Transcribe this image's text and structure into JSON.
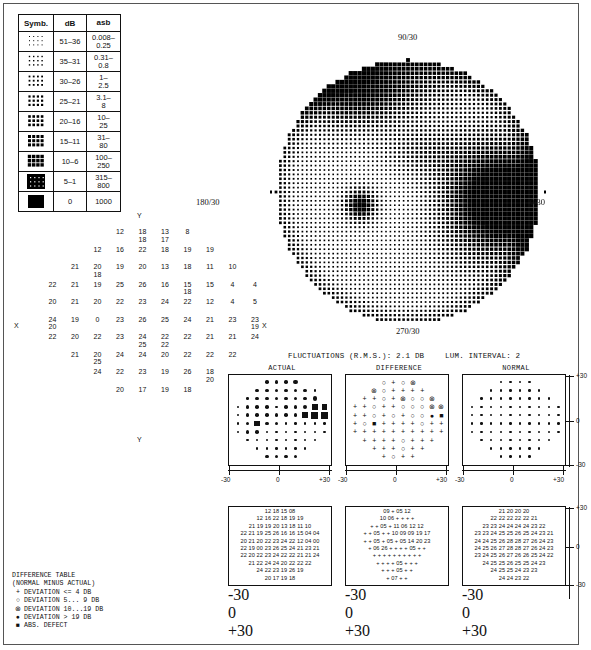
{
  "legend": {
    "headers": [
      "Symb.",
      "dB",
      "asb"
    ],
    "rows": [
      {
        "density": 1,
        "db": "51–36",
        "asb": "0.008– 0.25"
      },
      {
        "density": 2,
        "db": "35–31",
        "asb": "0.31– 0.8"
      },
      {
        "density": 3,
        "db": "30–26",
        "asb": "1– 2.5"
      },
      {
        "density": 4,
        "db": "25–21",
        "asb": "3.1– 8"
      },
      {
        "density": 5,
        "db": "20–16",
        "asb": "10– 25"
      },
      {
        "density": 6,
        "db": "15–11",
        "asb": "31– 80"
      },
      {
        "density": 7,
        "db": "10–6",
        "asb": "100– 250"
      },
      {
        "density": 8,
        "db": "5–1",
        "asb": "315– 800"
      },
      {
        "density": 9,
        "db": "0",
        "asb": "1000"
      }
    ]
  },
  "bigmap": {
    "label_top": "90/30",
    "label_bottom": "270/30",
    "label_left": "180/30",
    "label_right": "0/30"
  },
  "field_axis": {
    "x_label": "X",
    "y_label": "Y"
  },
  "field_numbers": {
    "rows": [
      {
        "start": 4,
        "values": [
          "12",
          "18\n18",
          "13\n17",
          "8"
        ]
      },
      {
        "start": 3,
        "values": [
          "12",
          "16",
          "22",
          "18",
          "19",
          "19"
        ]
      },
      {
        "start": 2,
        "values": [
          "21",
          "20\n18",
          "19",
          "20",
          "13",
          "18",
          "11",
          "10"
        ]
      },
      {
        "start": 1,
        "values": [
          "22",
          "21",
          "19",
          "25",
          "26",
          "16",
          "15\n18",
          "15",
          "4",
          "4"
        ]
      },
      {
        "start": 1,
        "values": [
          "20",
          "21",
          "20",
          "22",
          "23",
          "24",
          "22",
          "12",
          "4",
          "5"
        ]
      },
      {
        "start": 1,
        "values": [
          "24\n20",
          "19",
          "0",
          "23",
          "26",
          "25",
          "24",
          "21",
          "23",
          "23\n19"
        ]
      },
      {
        "start": 1,
        "values": [
          "22",
          "20",
          "22",
          "23",
          "24\n25",
          "22\n22",
          "22",
          "21",
          "21",
          "24"
        ]
      },
      {
        "start": 2,
        "values": [
          "21",
          "20\n25",
          "24",
          "24",
          "20",
          "22",
          "22",
          "22"
        ]
      },
      {
        "start": 3,
        "values": [
          "24",
          "22",
          "23",
          "19",
          "26",
          "18\n20"
        ]
      },
      {
        "start": 4,
        "values": [
          "20",
          "17",
          "19",
          "18"
        ]
      }
    ]
  },
  "fluctuations": {
    "rms_label": "FLUCTUATIONS (R.M.S.):  2.1 DB",
    "lum_label": "LUM. INTERVAL: 2"
  },
  "panels": {
    "titles": [
      "ACTUAL",
      "DIFFERENCE",
      "NORMAL"
    ],
    "x_ticks": [
      "-30",
      "0",
      "+30"
    ],
    "y_ticks": [
      "+30",
      "0",
      "-30"
    ],
    "actual": [
      [
        0,
        0,
        0,
        3,
        3,
        3,
        4,
        0,
        0,
        0
      ],
      [
        0,
        0,
        3,
        3,
        3,
        3,
        3,
        3,
        2,
        0
      ],
      [
        0,
        2,
        3,
        3,
        3,
        3,
        3,
        3,
        4,
        0
      ],
      [
        2,
        3,
        3,
        3,
        2,
        3,
        3,
        4,
        5,
        5
      ],
      [
        2,
        3,
        3,
        3,
        3,
        3,
        3,
        5,
        6,
        6
      ],
      [
        2,
        3,
        5,
        3,
        3,
        2,
        2,
        2,
        2,
        2
      ],
      [
        2,
        3,
        3,
        2,
        2,
        2,
        2,
        2,
        2,
        2
      ],
      [
        0,
        2,
        2,
        2,
        2,
        2,
        2,
        2,
        2,
        0
      ],
      [
        0,
        0,
        2,
        2,
        2,
        2,
        2,
        2,
        0,
        0
      ],
      [
        0,
        0,
        0,
        3,
        3,
        3,
        3,
        0,
        0,
        0
      ]
    ],
    "difference": [
      [
        "",
        "",
        "",
        "o",
        "+",
        "o",
        "x",
        "",
        "",
        ""
      ],
      [
        "",
        "",
        "x",
        "o",
        "+",
        "+",
        "+",
        "+",
        "",
        ""
      ],
      [
        "",
        "+",
        "+",
        "o",
        "+",
        "x",
        "o",
        "o",
        "x",
        ""
      ],
      [
        "+",
        "+",
        "o",
        "+",
        "+",
        "o",
        "o",
        "o",
        "x",
        "x"
      ],
      [
        "+",
        "+",
        "o",
        "+",
        "o",
        "+",
        "o",
        "o",
        "f",
        "b"
      ],
      [
        "+",
        "o",
        "b",
        "+",
        "+",
        "+",
        "+",
        "o",
        "+",
        "+"
      ],
      [
        "+",
        "+",
        "+",
        "+",
        "+",
        "+",
        "+",
        "+",
        "+",
        "+"
      ],
      [
        "",
        "+",
        "+",
        "+",
        "+",
        "o",
        "+",
        "+",
        "+",
        ""
      ],
      [
        "",
        "",
        "+",
        "+",
        "+",
        "o",
        "+",
        "+",
        "",
        ""
      ],
      [
        "",
        "",
        "",
        "+",
        "o",
        "+",
        "+",
        "",
        "",
        ""
      ]
    ],
    "normal": [
      [
        0,
        0,
        0,
        2,
        2,
        2,
        2,
        0,
        0,
        0
      ],
      [
        0,
        0,
        2,
        2,
        2,
        2,
        2,
        2,
        0,
        0
      ],
      [
        0,
        2,
        2,
        2,
        2,
        2,
        2,
        2,
        2,
        0
      ],
      [
        2,
        2,
        2,
        2,
        2,
        2,
        2,
        2,
        2,
        2
      ],
      [
        2,
        2,
        2,
        2,
        2,
        2,
        2,
        2,
        2,
        2
      ],
      [
        2,
        2,
        2,
        2,
        2,
        2,
        2,
        2,
        2,
        2
      ],
      [
        2,
        2,
        2,
        2,
        2,
        2,
        2,
        2,
        2,
        2
      ],
      [
        0,
        2,
        2,
        2,
        2,
        2,
        2,
        2,
        2,
        0
      ],
      [
        0,
        0,
        2,
        2,
        2,
        2,
        2,
        2,
        0,
        0
      ],
      [
        0,
        0,
        0,
        2,
        2,
        2,
        2,
        0,
        0,
        0
      ]
    ]
  },
  "tables": {
    "actual_rows": [
      "12 18 15 08",
      "12 16 22 18 19 19",
      "21 19 19 20 13 18 11 10",
      "22 21 19 25 26 16 16 15 04 04",
      "20 21 20 22 23 24 22 12 04 00",
      "22 19 00 23 26 25 24 21 23 21",
      "22 20 22 23 24 22 22 21 21 24",
      "21 22 24 24 20 22 22 22",
      "24 22 23 19 26 19",
      "20 17 19 18"
    ],
    "difference_rows": [
      "09 + 05 12",
      "10 06 + + + +",
      "+  + 05 + 11 06 12 12",
      "+  + 05 + + 10 09 09 19 17",
      "+  + 05 + 05 + 05 14 20 23",
      "+ 06 26 + + + + 05 + +",
      "+  +  + + + + + + + +",
      "+  +  + + 05 + + +",
      "+  +  + 05 + +",
      "+ 07 + +"
    ],
    "normal_rows": [
      "21 20 20 20",
      "22 22 22 22 22 21",
      "23 23 24 24 24 24 23 22",
      "23 23 24 25 25 26 25 24 23 21",
      "24 24 25 26 28 28 27 26 24 23",
      "24 25 26 27 28 28 27 26 24 23",
      "23 24 25 26 27 26 26 25 24 22",
      "24 25 25 26 25 25 24 23",
      "24 25 25 24 23 23",
      "24 24 23 22"
    ],
    "x_ticks": [
      "-30",
      "0",
      "+30"
    ],
    "y_ticks": [
      "+30",
      "0",
      "-30"
    ]
  },
  "difference_legend": {
    "title": "DIFFERENCE TABLE",
    "subtitle": "(NORMAL MINUS ACTUAL)",
    "entries": [
      {
        "glyph": "+",
        "text": "DEVIATION <= 4 DB"
      },
      {
        "glyph": "○",
        "text": "DEVIATION  5...  9 DB"
      },
      {
        "glyph": "⊗",
        "text": "DEVIATION 10...19 DB"
      },
      {
        "glyph": "●",
        "text": "DEVIATION > 19 DB"
      },
      {
        "glyph": "■",
        "text": "ABS. DEFECT"
      }
    ]
  }
}
